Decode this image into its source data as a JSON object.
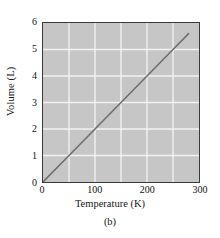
{
  "figure": {
    "caption": "(b)",
    "background_color": "#ffffff"
  },
  "chart_data": {
    "type": "line",
    "title": "",
    "subtitle": "",
    "xlabel": "Temperature (K)",
    "ylabel": "Volume (L)",
    "xlim": [
      0,
      300
    ],
    "ylim": [
      0,
      6
    ],
    "xticks": [
      0,
      100,
      200,
      300
    ],
    "xtick_labels": [
      "0",
      "100",
      "200",
      "300"
    ],
    "yticks": [
      0,
      1,
      2,
      3,
      4,
      5,
      6
    ],
    "ytick_labels": [
      "0",
      "1",
      "2",
      "3",
      "4",
      "5",
      "6"
    ],
    "grid": true,
    "grid_color": "#f2f2f2",
    "grid_x_minor_step": 50,
    "grid_y_step": 1,
    "plot_background_color": "#c6c6c6",
    "frame_color": "#3a3a3a",
    "legend": null,
    "legend_position": "none",
    "annotations": [],
    "series": [
      {
        "name": "Volume vs Temperature",
        "type": "line",
        "color": "#6e6e6e",
        "line_width": 1.6,
        "x": [
          0,
          50,
          100,
          150,
          200,
          250,
          280
        ],
        "y": [
          0,
          1.0,
          2.0,
          3.0,
          4.0,
          5.0,
          5.6
        ]
      }
    ]
  }
}
